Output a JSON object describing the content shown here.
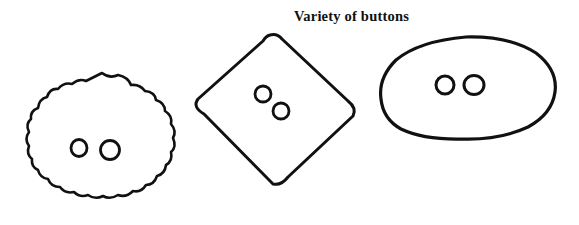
{
  "figure": {
    "title": "Variety of buttons",
    "background_color": "#ffffff",
    "ink_color": "#111111",
    "style": "hand-drawn line art",
    "width": 579,
    "height": 225,
    "buttons": [
      {
        "name": "scalloped-round-button",
        "shape_label": "scalloped circle",
        "center_x": 102,
        "center_y": 145,
        "radius": 72,
        "scallop_count": 18,
        "stroke_width": 2.6,
        "holes": [
          {
            "cx": 79,
            "cy": 148,
            "r": 8
          },
          {
            "cx": 110,
            "cy": 150,
            "r": 9.5
          }
        ]
      },
      {
        "name": "diamond-button",
        "shape_label": "rounded diamond",
        "center_x": 275,
        "center_y": 110,
        "half_width": 81,
        "half_height": 76,
        "stroke_width": 3,
        "holes": [
          {
            "cx": 263,
            "cy": 94,
            "r": 8
          },
          {
            "cx": 281,
            "cy": 111,
            "r": 8
          }
        ]
      },
      {
        "name": "oval-button",
        "shape_label": "oval",
        "center_x": 468,
        "center_y": 88,
        "radius_x": 88,
        "radius_y": 51,
        "stroke_width": 3.2,
        "holes": [
          {
            "cx": 445,
            "cy": 85,
            "r": 9
          },
          {
            "cx": 474,
            "cy": 85,
            "r": 10
          }
        ]
      }
    ]
  }
}
